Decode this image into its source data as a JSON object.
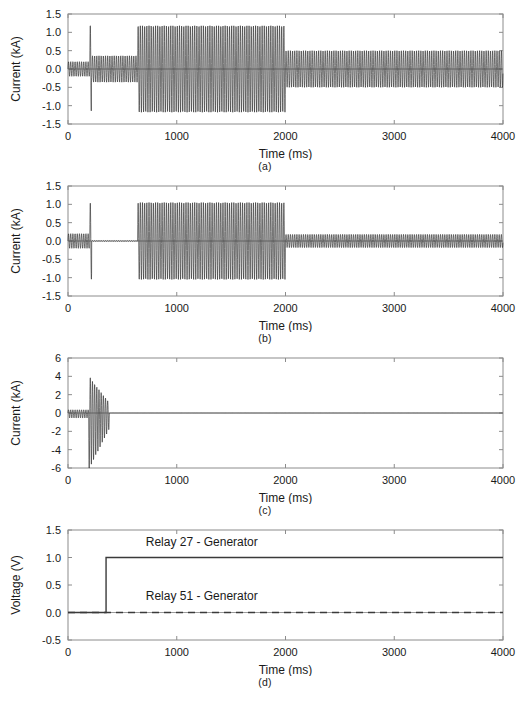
{
  "figure": {
    "panels": [
      {
        "caption": "(a)",
        "ylabel": "Current (kA)",
        "xlabel": "Time (ms)",
        "yticks": [
          "1.5",
          "1.0",
          "0.5",
          "0.0",
          "-0.5",
          "-1.0",
          "-1.5"
        ],
        "xticks": [
          "0",
          "1000",
          "2000",
          "3000",
          "4000"
        ]
      },
      {
        "caption": "(b)",
        "ylabel": "Current (kA)",
        "xlabel": "Time (ms)",
        "yticks": [
          "1.5",
          "1.0",
          "0.5",
          "0.0",
          "-0.5",
          "-1.0",
          "-1.5"
        ],
        "xticks": [
          "0",
          "1000",
          "2000",
          "3000",
          "4000"
        ]
      },
      {
        "caption": "(c)",
        "ylabel": "Current (kA)",
        "xlabel": "Time (ms)",
        "yticks": [
          "6",
          "4",
          "2",
          "0",
          "-2",
          "-4",
          "-6"
        ],
        "xticks": [
          "0",
          "1000",
          "2000",
          "3000",
          "4000"
        ]
      },
      {
        "caption": "(d)",
        "ylabel": "Voltage (V)",
        "xlabel": "Time (ms)",
        "yticks": [
          "1.5",
          "1.0",
          "0.5",
          "0.0",
          "-0.5"
        ],
        "xticks": [
          "0",
          "1000",
          "2000",
          "3000",
          "4000"
        ]
      }
    ]
  },
  "chart_data": [
    {
      "type": "line",
      "panel": "(a)",
      "title": "",
      "xlabel": "Time (ms)",
      "ylabel": "Current (kA)",
      "xlim": [
        0,
        4000
      ],
      "ylim": [
        -1.5,
        1.5
      ],
      "xticks": [
        0,
        1000,
        2000,
        3000,
        4000
      ],
      "yticks": [
        -1.5,
        -1.0,
        -0.5,
        0.0,
        0.5,
        1.0,
        1.5
      ],
      "grid": false,
      "legend": "none",
      "waveform": {
        "kind": "oscillation-envelope",
        "frequency_hz": 50,
        "envelope_segments": [
          {
            "t_start": 0,
            "t_end": 200,
            "amp_start": 0.2,
            "amp_end": 0.2
          },
          {
            "t_start": 200,
            "t_end": 215,
            "amp_start": 1.2,
            "amp_end": 1.2
          },
          {
            "t_start": 215,
            "t_end": 640,
            "amp_start": 0.36,
            "amp_end": 0.36
          },
          {
            "t_start": 640,
            "t_end": 2000,
            "amp_start": 1.18,
            "amp_end": 1.18
          },
          {
            "t_start": 2000,
            "t_end": 4000,
            "amp_start": 0.5,
            "amp_end": 0.5
          }
        ]
      }
    },
    {
      "type": "line",
      "panel": "(b)",
      "title": "",
      "xlabel": "Time (ms)",
      "ylabel": "Current (kA)",
      "xlim": [
        0,
        4000
      ],
      "ylim": [
        -1.5,
        1.5
      ],
      "xticks": [
        0,
        1000,
        2000,
        3000,
        4000
      ],
      "yticks": [
        -1.5,
        -1.0,
        -0.5,
        0.0,
        0.5,
        1.0,
        1.5
      ],
      "grid": false,
      "legend": "none",
      "waveform": {
        "kind": "oscillation-envelope",
        "frequency_hz": 50,
        "envelope_segments": [
          {
            "t_start": 0,
            "t_end": 195,
            "amp_start": 0.2,
            "amp_end": 0.2
          },
          {
            "t_start": 195,
            "t_end": 200,
            "amp_start": 0.02,
            "amp_end": 0.02
          },
          {
            "t_start": 200,
            "t_end": 218,
            "amp_start": 1.05,
            "amp_end": 1.05
          },
          {
            "t_start": 218,
            "t_end": 640,
            "amp_start": 0.01,
            "amp_end": 0.01
          },
          {
            "t_start": 640,
            "t_end": 2000,
            "amp_start": 1.05,
            "amp_end": 1.05
          },
          {
            "t_start": 2000,
            "t_end": 4000,
            "amp_start": 0.18,
            "amp_end": 0.18
          }
        ]
      }
    },
    {
      "type": "line",
      "panel": "(c)",
      "title": "",
      "xlabel": "Time (ms)",
      "ylabel": "Current (kA)",
      "xlim": [
        0,
        4000
      ],
      "ylim": [
        -6,
        6
      ],
      "xticks": [
        0,
        1000,
        2000,
        3000,
        4000
      ],
      "yticks": [
        -6,
        -4,
        -2,
        0,
        2,
        4,
        6
      ],
      "grid": false,
      "legend": "none",
      "waveform": {
        "kind": "oscillation-envelope",
        "frequency_hz": 50,
        "envelope_segments": [
          {
            "t_start": 0,
            "t_end": 190,
            "amp_start": 0.35,
            "amp_end": 0.35
          },
          {
            "t_start": 190,
            "t_end": 215,
            "amp_start": 4.3,
            "amp_end": 3.6
          },
          {
            "t_start": 215,
            "t_end": 380,
            "amp_start": 3.6,
            "amp_end": 1.1
          },
          {
            "t_start": 380,
            "t_end": 4000,
            "amp_start": 0.0,
            "amp_end": 0.0
          }
        ],
        "negative_bias": -0.55
      }
    },
    {
      "type": "line",
      "panel": "(d)",
      "title": "",
      "xlabel": "Time (ms)",
      "ylabel": "Voltage (V)",
      "xlim": [
        0,
        4000
      ],
      "ylim": [
        -0.5,
        1.5
      ],
      "xticks": [
        0,
        1000,
        2000,
        3000,
        4000
      ],
      "yticks": [
        -0.5,
        0.0,
        0.5,
        1.0,
        1.5
      ],
      "grid": false,
      "legend": "inline-annotations",
      "series": [
        {
          "name": "Relay 27 - Generator",
          "style": "solid",
          "label_x": 1230,
          "label_y": 1.28,
          "points": [
            [
              0,
              0.0
            ],
            [
              350,
              0.0
            ],
            [
              350,
              1.0
            ],
            [
              4000,
              1.0
            ]
          ]
        },
        {
          "name": "Relay 51 - Generator",
          "style": "dashed",
          "label_x": 1230,
          "label_y": 0.3,
          "points": [
            [
              0,
              0.0
            ],
            [
              4000,
              0.0
            ]
          ]
        }
      ]
    }
  ]
}
